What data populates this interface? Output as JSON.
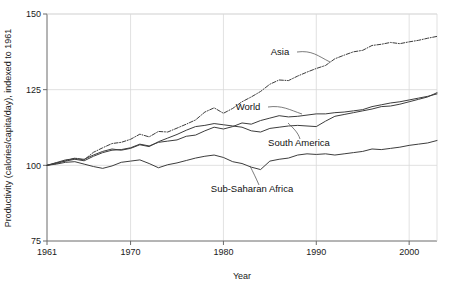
{
  "chart_data": {
    "type": "line",
    "title": "",
    "xlabel": "Year",
    "ylabel": "Productivity (calories/capita/day), indexed to 1961",
    "xlim": [
      1961,
      2003
    ],
    "ylim": [
      75,
      150
    ],
    "xticks": [
      1961,
      1970,
      1980,
      1990,
      2000
    ],
    "xtick_labels": [
      "1961",
      "1970",
      "1980",
      "1990",
      "2000"
    ],
    "yticks": [
      75,
      100,
      125,
      150
    ],
    "ytick_labels": [
      "75",
      "100",
      "125",
      "150"
    ],
    "grid": "both-inner",
    "legend": "inline-labels",
    "x": [
      1961,
      1962,
      1963,
      1964,
      1965,
      1966,
      1967,
      1968,
      1969,
      1970,
      1971,
      1972,
      1973,
      1974,
      1975,
      1976,
      1977,
      1978,
      1979,
      1980,
      1981,
      1982,
      1983,
      1984,
      1985,
      1986,
      1987,
      1988,
      1989,
      1990,
      1991,
      1992,
      1993,
      1994,
      1995,
      1996,
      1997,
      1998,
      1999,
      2000,
      2001,
      2002,
      2003
    ],
    "series": [
      {
        "name": "Asia",
        "style": "dash-dot",
        "values": [
          100,
          100.6,
          101.5,
          102.4,
          101.8,
          104.3,
          105.8,
          107.2,
          107.6,
          108.6,
          110.3,
          109.4,
          111.2,
          111.0,
          112.3,
          113.6,
          115.0,
          117.6,
          119.0,
          117.2,
          118.8,
          121.0,
          122.6,
          124.4,
          126.8,
          128.2,
          128.0,
          129.5,
          130.8,
          132.0,
          133.0,
          135.2,
          136.4,
          137.5,
          138.0,
          139.6,
          140.0,
          140.6,
          140.2,
          140.8,
          141.3,
          142.0,
          142.6
        ]
      },
      {
        "name": "World",
        "style": "solid",
        "values": [
          100,
          100.8,
          101.4,
          102.0,
          101.5,
          103.0,
          104.2,
          105.0,
          105.2,
          105.8,
          107.0,
          106.4,
          107.6,
          108.0,
          108.4,
          109.6,
          110.0,
          111.4,
          112.6,
          112.0,
          112.8,
          114.0,
          113.6,
          114.8,
          115.6,
          116.4,
          116.0,
          116.2,
          116.6,
          117.0,
          117.0,
          117.4,
          117.6,
          118.0,
          118.4,
          119.4,
          120.0,
          120.6,
          121.0,
          121.6,
          122.2,
          122.8,
          123.6
        ]
      },
      {
        "name": "South America",
        "style": "solid",
        "values": [
          100,
          100.9,
          101.8,
          102.2,
          102.0,
          103.4,
          104.6,
          105.4,
          105.0,
          105.6,
          106.8,
          106.2,
          107.8,
          109.0,
          110.2,
          111.6,
          112.8,
          113.2,
          113.8,
          113.4,
          113.0,
          112.6,
          111.4,
          111.0,
          112.2,
          112.6,
          113.0,
          113.2,
          113.0,
          112.8,
          114.6,
          116.2,
          116.8,
          117.4,
          118.0,
          118.6,
          119.4,
          119.6,
          120.2,
          121.0,
          121.8,
          122.6,
          124.0
        ]
      },
      {
        "name": "Sub-Saharan Africa",
        "style": "solid",
        "values": [
          100,
          100.4,
          101.0,
          101.2,
          100.4,
          99.6,
          99.0,
          99.8,
          101.0,
          101.4,
          101.8,
          100.6,
          99.2,
          100.2,
          100.8,
          101.6,
          102.4,
          103.0,
          103.4,
          102.6,
          101.2,
          100.6,
          99.4,
          98.6,
          101.4,
          102.0,
          102.4,
          103.4,
          103.8,
          103.6,
          103.8,
          103.4,
          103.8,
          104.2,
          104.6,
          105.4,
          105.2,
          105.6,
          106.0,
          106.6,
          107.0,
          107.4,
          108.2
        ]
      }
    ],
    "annotations": [
      {
        "label": "Asia",
        "x": 280,
        "y": 55
      },
      {
        "label": "World",
        "x": 248,
        "y": 110
      },
      {
        "label": "South America",
        "x": 299,
        "y": 146
      },
      {
        "label": "Sub-Saharan Africa",
        "x": 252,
        "y": 192
      }
    ]
  }
}
